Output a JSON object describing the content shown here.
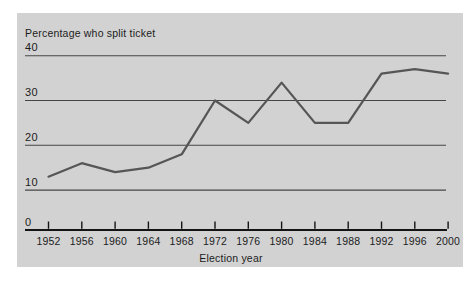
{
  "window": {
    "background": "#ffffff"
  },
  "chart": {
    "panel_bg": "#d2d2d2",
    "grid_color": "#464646",
    "axis_color": "#141414",
    "tick_color": "#141414",
    "line_color": "#565656",
    "text_color": "#1c1c1c"
  },
  "chart_data": {
    "type": "line",
    "title": "Percentage who split ticket",
    "xlabel": "Election year",
    "ylabel": "",
    "categories": [
      "1952",
      "1956",
      "1960",
      "1964",
      "1968",
      "1972",
      "1976",
      "1980",
      "1984",
      "1988",
      "1992",
      "1996",
      "2000"
    ],
    "values": [
      13,
      16,
      14,
      15,
      18,
      30,
      25,
      34,
      25,
      25,
      36,
      37,
      36
    ],
    "yticks": [
      0,
      10,
      20,
      30,
      40
    ],
    "ylim": [
      0,
      40
    ],
    "grid": "horizontal-only",
    "legend": "none"
  }
}
